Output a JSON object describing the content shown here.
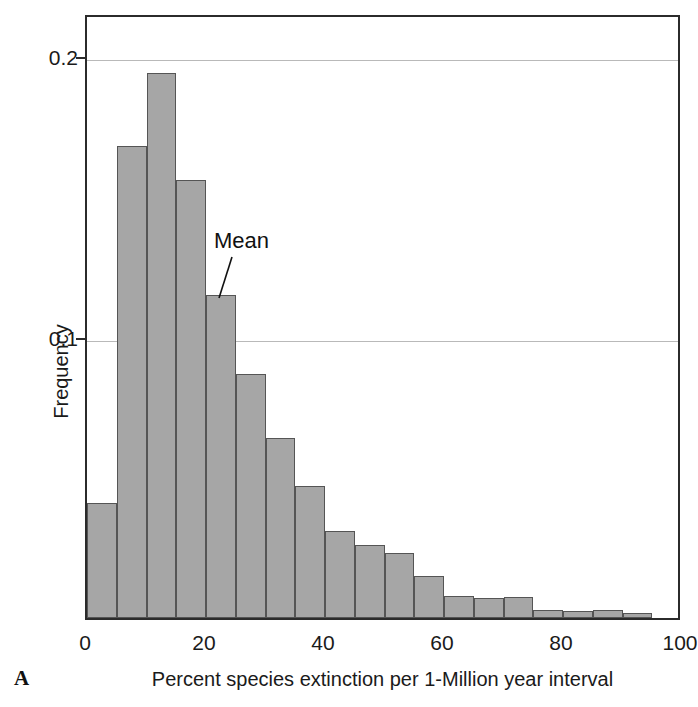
{
  "panel": {
    "label": "A"
  },
  "annotation": {
    "mean_label": "Mean"
  },
  "colors": {
    "bar_fill": "#a6a6a6",
    "bar_edge": "#555555",
    "frame": "#2b2b2b",
    "gridline": "#b9b9b9",
    "text": "#1a1a1a"
  },
  "chart_data": {
    "type": "bar",
    "title": "",
    "subtitle": "",
    "xlabel": "Percent species extinction per 1-Million year interval",
    "ylabel": "Frequency",
    "xlim": [
      0,
      100
    ],
    "ylim": [
      0,
      0.215
    ],
    "xticks": [
      0,
      20,
      40,
      60,
      80,
      100
    ],
    "xtick_labels": [
      "0",
      "20",
      "40",
      "60",
      "80",
      "100"
    ],
    "yticks": [
      0.1,
      0.2
    ],
    "ytick_labels": [
      "0.1",
      "0.2"
    ],
    "grid": "horizontal-at-yticks",
    "legend": "none",
    "bin_width": 5,
    "bin_starts": [
      0,
      5,
      10,
      15,
      20,
      25,
      30,
      35,
      40,
      45,
      50,
      55,
      60,
      65,
      70,
      75,
      80,
      85,
      90
    ],
    "bin_labels": [
      "0-5",
      "5-10",
      "10-15",
      "15-20",
      "20-25",
      "25-30",
      "30-35",
      "35-40",
      "40-45",
      "45-50",
      "50-55",
      "55-60",
      "60-65",
      "65-70",
      "70-75",
      "75-80",
      "80-85",
      "85-90",
      "90-95"
    ],
    "values": [
      0.041,
      0.168,
      0.194,
      0.156,
      0.115,
      0.087,
      0.064,
      0.047,
      0.031,
      0.026,
      0.023,
      0.015,
      0.008,
      0.007,
      0.0075,
      0.003,
      0.0025,
      0.003,
      0.0018
    ],
    "annotations": [
      {
        "text": "Mean",
        "points_to_bin": "20-25",
        "x": 22.5,
        "y": 0.115
      }
    ]
  }
}
